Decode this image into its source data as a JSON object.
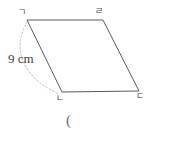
{
  "figure": {
    "type": "parallelogram-diagram",
    "background_color": "#ffffff",
    "stroke_color": "#555555",
    "arc_color": "#b9b9b9",
    "label_color": "#4a4a4a",
    "vertices": {
      "top_left": {
        "label": "ㄱ",
        "x": 27,
        "y": 20
      },
      "top_right": {
        "label": "ㄹ",
        "x": 103,
        "y": 20
      },
      "bottom_right": {
        "label": "ㄷ",
        "x": 139,
        "y": 91
      },
      "bottom_left": {
        "label": "ㄴ",
        "x": 62,
        "y": 92
      }
    },
    "measurement": {
      "value": "9",
      "unit": "cm",
      "text": "9 cm",
      "measures_side": "top_left-to-bottom_left"
    },
    "arc": {
      "style": "dashed",
      "from": "top_left",
      "to": "bottom_left",
      "bulge": "left"
    },
    "caption": {
      "text": "("
    }
  }
}
